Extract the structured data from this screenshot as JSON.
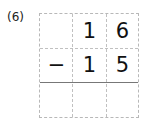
{
  "problem": {
    "label": "(6)",
    "rows": [
      [
        "",
        "1",
        "6"
      ],
      [
        "−",
        "1",
        "5"
      ],
      [
        "",
        "",
        ""
      ]
    ],
    "operation": "subtraction"
  }
}
